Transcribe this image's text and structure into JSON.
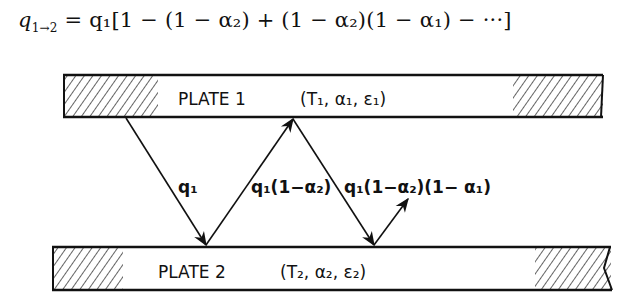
{
  "equation": {
    "lhs": "q",
    "lhs_sub": "1→2",
    "rhs": "= q₁[1 − (1 − α₂) + (1 − α₂)(1 − α₁) − ···]"
  },
  "plate1": {
    "label": "PLATE  1",
    "props": "(T₁, α₁, ε₁)"
  },
  "plate2": {
    "label": "PLATE  2",
    "props": "(T₂, α₂, ε₂)"
  },
  "rays": [
    {
      "label": "q₁"
    },
    {
      "label": "q₁(1−α₂)"
    },
    {
      "label": "q₁(1−α₂)(1− α₁)"
    }
  ]
}
